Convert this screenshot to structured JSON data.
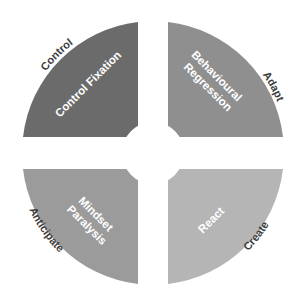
{
  "diagram": {
    "type": "four-quadrant-circle",
    "quadrants": [
      {
        "position": "top-left",
        "inner_label_lines": [
          "Control Fixation"
        ],
        "outer_label": "Control",
        "color": "#6b6b6b"
      },
      {
        "position": "top-right",
        "inner_label_lines": [
          "Behavioural",
          "Regression"
        ],
        "outer_label": "Adapt",
        "color": "#8f8f8f"
      },
      {
        "position": "bottom-left",
        "inner_label_lines": [
          "Mindset",
          "Paralysis"
        ],
        "outer_label": "Anticipate",
        "color": "#9b9b9b"
      },
      {
        "position": "bottom-right",
        "inner_label_lines": [
          "React"
        ],
        "outer_label": "Create",
        "color": "#b5b5b5"
      }
    ]
  }
}
